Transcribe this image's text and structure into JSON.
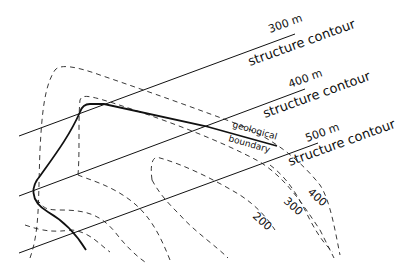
{
  "diagram": {
    "structure_contours": [
      {
        "value": "300 m",
        "label": "structure contour"
      },
      {
        "value": "400 m",
        "label": "structure contour"
      },
      {
        "value": "500 m",
        "label": "structure contour"
      }
    ],
    "topographic_contours": [
      {
        "label": "400"
      },
      {
        "label": "300"
      },
      {
        "label": "200"
      }
    ],
    "boundary_label_line1": "geological",
    "boundary_label_line2": "boundary",
    "colors": {
      "line": "#111111",
      "background": "#ffffff"
    }
  }
}
